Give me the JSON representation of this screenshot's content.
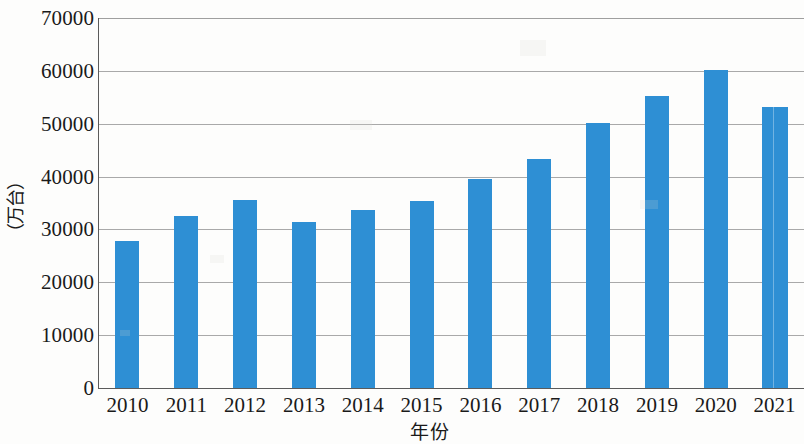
{
  "chart_data": {
    "type": "bar",
    "title": "",
    "subtitle": "",
    "xlabel": "年份",
    "ylabel": "（万台）",
    "categories": [
      "2010",
      "2011",
      "2012",
      "2013",
      "2014",
      "2015",
      "2016",
      "2017",
      "2018",
      "2019",
      "2020",
      "2021"
    ],
    "values": [
      27800,
      32500,
      35500,
      31500,
      33600,
      35400,
      39500,
      43300,
      50200,
      55200,
      60200,
      53100
    ],
    "ylim": [
      0,
      70000
    ],
    "yticks": [
      0,
      10000,
      20000,
      30000,
      40000,
      50000,
      60000,
      70000
    ],
    "ytick_labels": [
      "0",
      "10000",
      "20000",
      "30000",
      "40000",
      "50000",
      "60000",
      "70000"
    ],
    "grid": true,
    "grid_axis": "y",
    "legend": null,
    "legend_position": "none",
    "series": [
      {
        "name": "产量",
        "color": "#2e8fd4",
        "values": [
          27800,
          32500,
          35500,
          31500,
          33600,
          35400,
          39500,
          43300,
          50200,
          55200,
          60200,
          53100
        ]
      }
    ],
    "bar_color": "#2e8fd4",
    "background_color": "#fdfdfc",
    "axis_color": "#5b5b5b",
    "grid_color": "#9a9a9a"
  }
}
